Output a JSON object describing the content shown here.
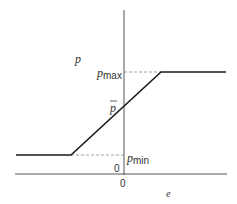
{
  "diagram": {
    "type": "piecewise-linear saturation function",
    "y_axis_label": "p",
    "x_axis_label": "e",
    "origin_x_label": "0",
    "origin_y_label": "0",
    "p_max": {
      "base": "p",
      "sub": "max"
    },
    "p_min": {
      "base": "p",
      "sub": "min"
    },
    "p_bar": "p",
    "colors": {
      "curve": "#1a1a1a",
      "axis": "#555555",
      "dashed": "#888888",
      "text": "#333333"
    }
  }
}
